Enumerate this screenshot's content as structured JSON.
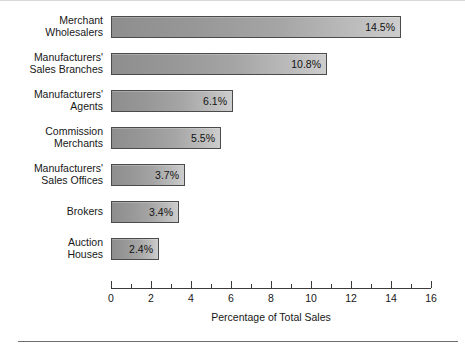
{
  "chart_data": {
    "type": "bar",
    "orientation": "horizontal",
    "title": "",
    "xlabel": "Percentage of Total Sales",
    "ylabel": "",
    "categories": [
      "Merchant\nWholesalers",
      "Manufacturers'\nSales Branches",
      "Manufacturers'\nAgents",
      "Commission\nMerchants",
      "Manufacturers'\nSales Offices",
      "Brokers",
      "Auction\nHouses"
    ],
    "values": [
      14.5,
      10.8,
      6.1,
      5.5,
      3.7,
      3.4,
      2.4
    ],
    "value_labels": [
      "14.5%",
      "10.8%",
      "6.1%",
      "5.5%",
      "3.7%",
      "3.4%",
      "2.4%"
    ],
    "xlim": [
      0,
      16
    ],
    "xticks": [
      0,
      2,
      4,
      6,
      8,
      10,
      12,
      14,
      16
    ],
    "xtick_labels": [
      "0",
      "2",
      "4",
      "6",
      "8",
      "10",
      "12",
      "14",
      "16"
    ],
    "minor_xticks": [
      1,
      3,
      5,
      7,
      9,
      11,
      13,
      15
    ],
    "grid": false,
    "legend": null,
    "units": "percent",
    "bar_fill_start_color": "#8e8e8e",
    "bar_fill_end_color": "#cdcdcd",
    "bar_border_color": "#4b4b4b",
    "axis_color": "#3b3b3b",
    "text_color": "#171717",
    "background_color": "#ffffff"
  }
}
